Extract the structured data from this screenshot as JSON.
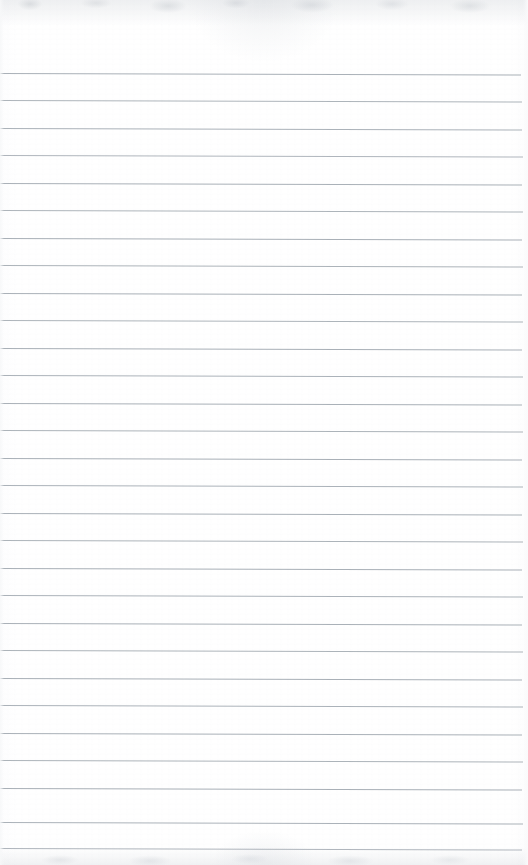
{
  "document": {
    "kind": "scanned-lined-notepad-page",
    "surface_label": "blank ruled paper",
    "page_width": 528,
    "page_height": 865,
    "paper_color": "#fefeff",
    "rule_color": "#9ba3ab",
    "scan_edge_color": "#cdd1d6",
    "text_content": "",
    "written_content": "",
    "handwriting": "",
    "printed_text": ""
  },
  "ruling": {
    "style": "wide-ruled horizontal lines",
    "line_count": 29,
    "first_line_y": 73,
    "line_spacing": 27.4,
    "line_thickness": 1,
    "line_left_x": 0,
    "line_right_x": 521,
    "slope_px_across_page": 1.5,
    "lines": [
      {
        "index": 1,
        "y": 73,
        "left": 0,
        "width": 521,
        "opacity": 0.85
      },
      {
        "index": 2,
        "y": 100,
        "left": 0,
        "width": 522,
        "opacity": 0.82
      },
      {
        "index": 3,
        "y": 128,
        "left": 0,
        "width": 522,
        "opacity": 0.84
      },
      {
        "index": 4,
        "y": 155,
        "left": 0,
        "width": 523,
        "opacity": 0.8
      },
      {
        "index": 5,
        "y": 183,
        "left": 0,
        "width": 522,
        "opacity": 0.85
      },
      {
        "index": 6,
        "y": 210,
        "left": 0,
        "width": 523,
        "opacity": 0.82
      },
      {
        "index": 7,
        "y": 238,
        "left": 0,
        "width": 522,
        "opacity": 0.86
      },
      {
        "index": 8,
        "y": 265,
        "left": 0,
        "width": 523,
        "opacity": 0.83
      },
      {
        "index": 9,
        "y": 293,
        "left": 0,
        "width": 522,
        "opacity": 0.85
      },
      {
        "index": 10,
        "y": 320,
        "left": 0,
        "width": 523,
        "opacity": 0.82
      },
      {
        "index": 11,
        "y": 348,
        "left": 0,
        "width": 522,
        "opacity": 0.86
      },
      {
        "index": 12,
        "y": 375,
        "left": 0,
        "width": 523,
        "opacity": 0.84
      },
      {
        "index": 13,
        "y": 403,
        "left": 0,
        "width": 522,
        "opacity": 0.85
      },
      {
        "index": 14,
        "y": 412,
        "left": 0,
        "width": 0,
        "opacity": 0
      },
      {
        "index": 15,
        "y": 430,
        "left": 0,
        "width": 523,
        "opacity": 0.83
      },
      {
        "index": 16,
        "y": 458,
        "left": 0,
        "width": 522,
        "opacity": 0.86
      },
      {
        "index": 17,
        "y": 467,
        "left": 0,
        "width": 0,
        "opacity": 0
      },
      {
        "index": 18,
        "y": 485,
        "left": 0,
        "width": 523,
        "opacity": 0.84
      },
      {
        "index": 19,
        "y": 513,
        "left": 0,
        "width": 522,
        "opacity": 0.85
      },
      {
        "index": 20,
        "y": 540,
        "left": 0,
        "width": 523,
        "opacity": 0.83
      },
      {
        "index": 21,
        "y": 568,
        "left": 0,
        "width": 522,
        "opacity": 0.86
      },
      {
        "index": 22,
        "y": 595,
        "left": 0,
        "width": 523,
        "opacity": 0.84
      },
      {
        "index": 23,
        "y": 623,
        "left": 0,
        "width": 522,
        "opacity": 0.85
      },
      {
        "index": 24,
        "y": 650,
        "left": 0,
        "width": 523,
        "opacity": 0.83
      },
      {
        "index": 25,
        "y": 678,
        "left": 0,
        "width": 522,
        "opacity": 0.86
      },
      {
        "index": 26,
        "y": 705,
        "left": 0,
        "width": 523,
        "opacity": 0.84
      },
      {
        "index": 27,
        "y": 733,
        "left": 0,
        "width": 522,
        "opacity": 0.85
      },
      {
        "index": 28,
        "y": 760,
        "left": 0,
        "width": 523,
        "opacity": 0.83
      },
      {
        "index": 29,
        "y": 788,
        "left": 0,
        "width": 522,
        "opacity": 0.86
      },
      {
        "index": 30,
        "y": 822,
        "left": 0,
        "width": 523,
        "opacity": 0.84
      },
      {
        "index": 31,
        "y": 848,
        "left": 0,
        "width": 522,
        "opacity": 0.8
      }
    ]
  },
  "margins": {
    "top_blank_height": 73,
    "left_margin_rule": "none",
    "right_edge_gap": 6,
    "has_vertical_margin_line": false,
    "has_holes": false,
    "has_header": false
  },
  "annotations": {
    "top_edge_artifact": "faint mottled grey scan shadow",
    "bottom_edge_artifact": "faint mottled grey scan shadow",
    "notes": "No handwriting, no printed text, no logos present on the page"
  }
}
